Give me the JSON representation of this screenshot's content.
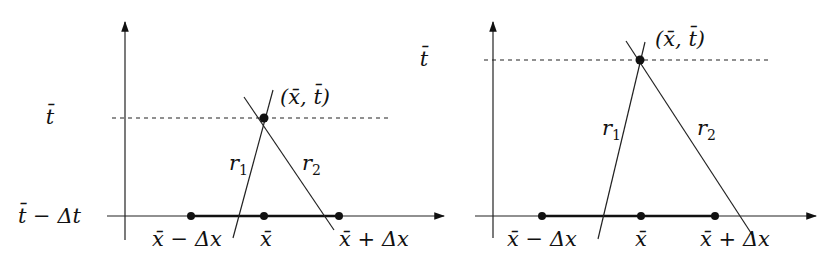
{
  "figure": {
    "colors": {
      "ink": "#111111",
      "background": "#ffffff"
    },
    "left_panel": {
      "y_labels": {
        "top": "t̄",
        "bottom": "t̄ − Δt"
      },
      "point_label": "(x̄, t̄)",
      "ray_labels": {
        "r1": "r",
        "r1_sub": "1",
        "r2": "r",
        "r2_sub": "2"
      },
      "x_labels": {
        "left": "x̄ − Δx",
        "center": "x̄",
        "right": "x̄ + Δx"
      }
    },
    "right_panel": {
      "y_labels": {
        "top": "t̄"
      },
      "point_label": "(x̄, t̄)",
      "ray_labels": {
        "r1": "r",
        "r1_sub": "1",
        "r2": "r",
        "r2_sub": "2"
      },
      "x_labels": {
        "left": "x̄ − Δx",
        "center": "x̄",
        "right": "x̄ + Δx"
      }
    }
  }
}
